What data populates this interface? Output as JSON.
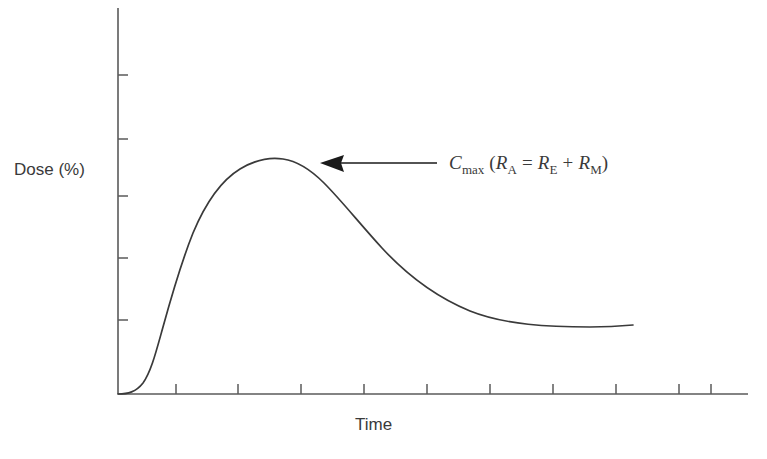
{
  "chart_data": {
    "type": "line",
    "title": "",
    "xlabel": "Time",
    "ylabel": "Dose (%)",
    "grid": false,
    "legend": null,
    "axis": {
      "x_tick_count": 10,
      "y_tick_count": 5,
      "x_tick_labels": [],
      "y_tick_labels": [],
      "tick_direction": "inward",
      "xlim": [
        0,
        100
      ],
      "ylim": [
        0,
        100
      ]
    },
    "series": [
      {
        "name": "Dose remaining in body",
        "x": [
          0,
          2,
          4,
          6,
          8,
          11,
          14,
          17,
          20,
          23,
          26,
          29,
          33,
          38,
          43,
          48,
          53,
          58,
          63,
          68,
          73,
          78,
          82,
          86,
          90,
          95,
          100
        ],
        "values": [
          0,
          0.3,
          1.5,
          5,
          12,
          26,
          42,
          57,
          69,
          78,
          84,
          88,
          90,
          89,
          86,
          81,
          75,
          69,
          62,
          56,
          50,
          44,
          39,
          34,
          30,
          25,
          21
        ]
      }
    ],
    "annotations": [
      {
        "name": "cmax-label",
        "arrow": "left",
        "text_parts": [
          {
            "style": "var",
            "text": "C"
          },
          {
            "style": "sub",
            "text": "max"
          },
          {
            "style": "paren",
            "text": " ("
          },
          {
            "style": "var",
            "text": "R"
          },
          {
            "style": "sub",
            "text": "A"
          },
          {
            "style": "op",
            "text": " = "
          },
          {
            "style": "var",
            "text": "R"
          },
          {
            "style": "sub",
            "text": "E"
          },
          {
            "style": "op",
            "text": " + "
          },
          {
            "style": "var",
            "text": "R"
          },
          {
            "style": "sub",
            "text": "M"
          },
          {
            "style": "paren",
            "text": ")"
          }
        ],
        "plain_text": "Cmax (RA = RE + RM)"
      }
    ],
    "colors": {
      "background": "#ffffff",
      "curve": "#3a3a3a",
      "axis": "#5a5a5a",
      "text": "#3a3a3a",
      "arrow": "#1a1a1a"
    }
  }
}
